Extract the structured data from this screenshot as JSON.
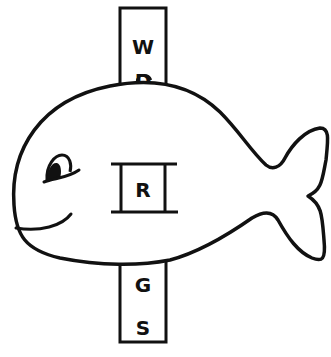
{
  "illustration": {
    "subject": "whale with sliding letter strip",
    "colors": {
      "ink": "#111111",
      "paper": "#ffffff"
    },
    "strip": {
      "letters_above": [
        "W",
        "D"
      ],
      "letters_below": [
        "G",
        "S"
      ]
    },
    "window": {
      "letter": "R"
    }
  }
}
